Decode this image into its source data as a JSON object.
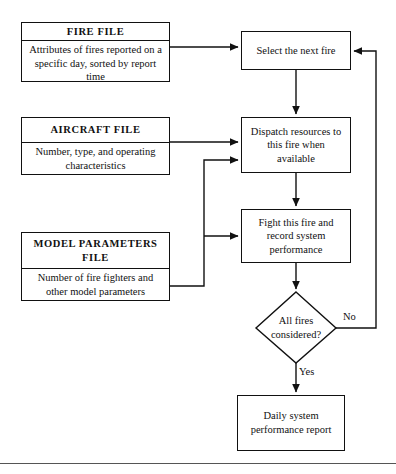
{
  "diagram": {
    "line_color": "#111111",
    "background": "#ffffff",
    "footer_rule_color": "#555555",
    "input_files": [
      {
        "id": "fire-file",
        "title": "FIRE  FILE",
        "description": "Attributes of fires reported on a specific day, sorted by report time"
      },
      {
        "id": "aircraft-file",
        "title": "AIRCRAFT  FILE",
        "description": "Number, type, and operating characteristics"
      },
      {
        "id": "model-parameters-file",
        "title": "MODEL  PARAMETERS FILE",
        "description": "Number of fire fighters and other model parameters"
      }
    ],
    "process_nodes": [
      {
        "id": "select-fire",
        "label": "Select the next fire"
      },
      {
        "id": "dispatch-resources",
        "label": "Dispatch resources to this fire when available"
      },
      {
        "id": "fight-fire",
        "label": "Fight this fire and record system performance"
      },
      {
        "id": "daily-report",
        "label": "Daily system performance report"
      }
    ],
    "decision": {
      "id": "all-fires-considered",
      "label": "All fires considered?",
      "branches": [
        {
          "id": "no",
          "label": "No",
          "target": "select-fire"
        },
        {
          "id": "yes",
          "label": "Yes",
          "target": "daily-report"
        }
      ]
    }
  }
}
